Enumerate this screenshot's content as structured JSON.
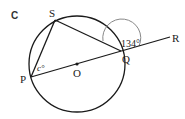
{
  "figure": {
    "part_label": "C",
    "points": {
      "S": "S",
      "P": "P",
      "O": "O",
      "Q": "Q",
      "R": "R"
    },
    "angles": {
      "at_P": "c°",
      "exterior_at_Q": "134°"
    },
    "colors": {
      "stroke": "#1a1a1a",
      "arc": "#888888",
      "text": "#222222"
    }
  }
}
